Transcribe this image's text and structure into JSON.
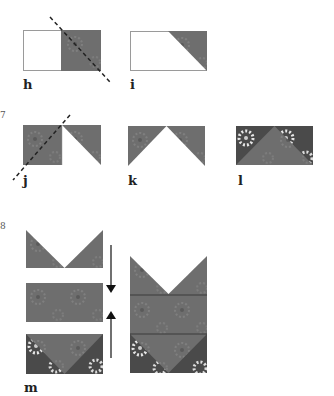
{
  "figure": {
    "colors": {
      "fabric_mid": "#6e6e6e",
      "fabric_dark": "#4a4a4a",
      "fabric_flower": "#8c8c8c",
      "fabric_flower_light": "#e6e6e6",
      "outline": "#9a9a9a",
      "white": "#ffffff",
      "dash": "#222222",
      "arrow": "#111111"
    },
    "step_markers": {
      "seven": "7",
      "eight": "8"
    },
    "panels": [
      {
        "id": "h",
        "label": "h",
        "caption": "half white, half fabric with diagonal cut line"
      },
      {
        "id": "i",
        "label": "i",
        "caption": "white rectangle with fabric triangle at upper-right corner"
      },
      {
        "id": "j",
        "label": "j",
        "caption": "fabric square with folded white triangle and diagonal cut line"
      },
      {
        "id": "k",
        "label": "k",
        "caption": "white center triangle flanked by fabric triangles"
      },
      {
        "id": "l",
        "label": "l",
        "caption": "flying-goose unit, mid fabric triangle on dark floral background"
      },
      {
        "id": "m",
        "label": "m",
        "caption": "three units stacked and joined"
      }
    ]
  }
}
